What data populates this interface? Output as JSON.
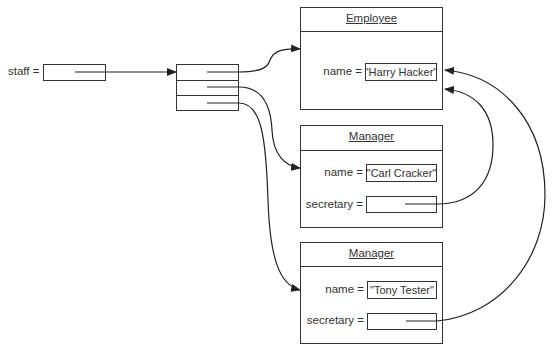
{
  "diagram": {
    "caption_cut_off": "",
    "staff": {
      "label": "staff ="
    },
    "array": {
      "rows": 3
    },
    "objects": [
      {
        "class_name": "Employee",
        "fields": [
          {
            "label": "name =",
            "value": "\"Harry Hacker\""
          }
        ]
      },
      {
        "class_name": "Manager",
        "fields": [
          {
            "label": "name =",
            "value": "\"Carl Cracker\""
          },
          {
            "label": "secretary =",
            "value": ""
          }
        ]
      },
      {
        "class_name": "Manager",
        "fields": [
          {
            "label": "name =",
            "value": "\"Tony Tester\""
          },
          {
            "label": "secretary =",
            "value": ""
          }
        ]
      }
    ],
    "references": [
      {
        "from": "staff",
        "to": "array"
      },
      {
        "from": "array[0]",
        "to": "Employee (Harry Hacker)"
      },
      {
        "from": "array[1]",
        "to": "Manager (Carl Cracker)"
      },
      {
        "from": "array[2]",
        "to": "Manager (Tony Tester)"
      },
      {
        "from": "Carl Cracker.secretary",
        "to": "Employee (Harry Hacker)"
      },
      {
        "from": "Tony Tester.secretary",
        "to": "Employee (Harry Hacker)"
      }
    ],
    "colors": {
      "line": "#333333",
      "background": "#ffffff"
    }
  }
}
